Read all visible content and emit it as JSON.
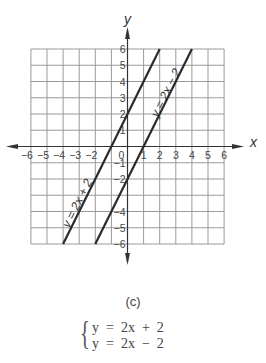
{
  "figure": {
    "caption": "(c)",
    "system": {
      "equations": [
        "y  =  2x  +  2",
        "y  =  2x  −  2"
      ]
    }
  },
  "chart_data": {
    "type": "line",
    "title": "",
    "xlabel": "x",
    "ylabel": "y",
    "xlim": [
      -6,
      6
    ],
    "ylim": [
      -6,
      6
    ],
    "grid": true,
    "x_ticks": [
      -6,
      -5,
      -4,
      -3,
      -2,
      -1,
      0,
      1,
      2,
      3,
      4,
      5,
      6
    ],
    "x_tick_labels": [
      "−6",
      "−5",
      "−4",
      "−3",
      "−2",
      "",
      "0",
      "1",
      "2",
      "3",
      "4",
      "5",
      "6"
    ],
    "y_ticks": [
      -6,
      -5,
      -4,
      -3,
      -2,
      -1,
      0,
      1,
      2,
      3,
      4,
      5,
      6
    ],
    "y_tick_labels": [
      "−6",
      "−5",
      "−4",
      "",
      "−2",
      "−1",
      "0",
      "1",
      "2",
      "3",
      "4",
      "5",
      "6"
    ],
    "series": [
      {
        "name": "y = 2x + 2",
        "label": "y = 2x + 2",
        "slope": 2,
        "intercept": 2,
        "x": [
          -4,
          2
        ],
        "y": [
          -6,
          6
        ]
      },
      {
        "name": "y = 2x − 2",
        "label": "y = 2x − 2",
        "slope": 2,
        "intercept": -2,
        "x": [
          -2,
          4
        ],
        "y": [
          -6,
          6
        ]
      }
    ],
    "colors": {
      "grid": "#9a9a9a",
      "lines": "#2a2a2a",
      "axes": "#333333"
    }
  }
}
